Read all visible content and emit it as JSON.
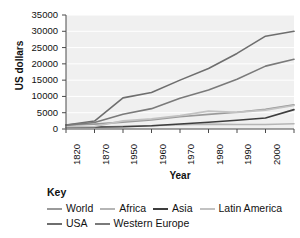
{
  "chart_data": {
    "type": "line",
    "title": "",
    "xlabel": "Year",
    "ylabel": "US dollars",
    "x": [
      "1820",
      "1870",
      "1950",
      "1960",
      "1970",
      "1980",
      "1990",
      "2000",
      "2010"
    ],
    "ylim": [
      0,
      35000
    ],
    "ytick_labels": [
      "0",
      "5000",
      "10000",
      "15000",
      "20000",
      "25000",
      "30000",
      "35000"
    ],
    "ytick_values": [
      0,
      5000,
      10000,
      15000,
      20000,
      25000,
      30000,
      35000
    ],
    "grid": "horizontal",
    "legend_position": "below",
    "legend_title": "Key",
    "series": [
      {
        "name": "World",
        "color": "#9a9a9a",
        "values": [
          1200,
          1500,
          2100,
          2800,
          3750,
          4500,
          5150,
          6050,
          7400
        ]
      },
      {
        "name": "Africa",
        "color": "#b5b5b5",
        "values": [
          450,
          550,
          850,
          1000,
          1300,
          1500,
          1400,
          1400,
          1600
        ]
      },
      {
        "name": "Asia",
        "color": "#3d3d3d",
        "values": [
          600,
          600,
          700,
          1000,
          1550,
          2050,
          2700,
          3400,
          5950
        ]
      },
      {
        "name": "Latin America",
        "color": "#c2c2c2",
        "values": [
          700,
          750,
          2500,
          3100,
          4100,
          5500,
          5100,
          5800,
          7200
        ]
      },
      {
        "name": "USA",
        "color": "#6e6e6e",
        "values": [
          1250,
          2450,
          9550,
          11200,
          15000,
          18600,
          23200,
          28500,
          30000
        ]
      },
      {
        "name": "Western Europe",
        "color": "#7a7a7a",
        "values": [
          1200,
          2000,
          4550,
          6250,
          9450,
          12000,
          15300,
          19300,
          21400
        ]
      }
    ]
  },
  "chart": {
    "y_axis_title": "US dollars",
    "x_axis_title": "Year"
  },
  "key": {
    "title": "Key",
    "rows": [
      [
        {
          "label": "World",
          "color": "#9a9a9a"
        },
        {
          "label": "Africa",
          "color": "#b5b5b5"
        },
        {
          "label": "Asia",
          "color": "#3d3d3d"
        },
        {
          "label": "Latin America",
          "color": "#c2c2c2"
        }
      ],
      [
        {
          "label": "USA",
          "color": "#6e6e6e"
        },
        {
          "label": "Western Europe",
          "color": "#7a7a7a"
        }
      ]
    ]
  }
}
